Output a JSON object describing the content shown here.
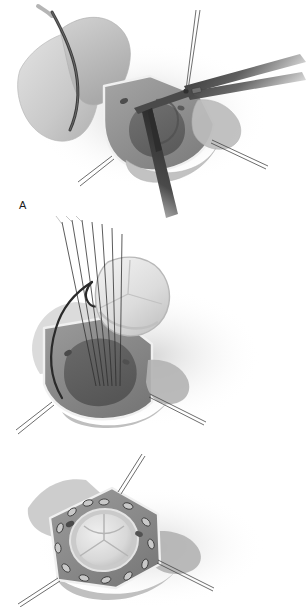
{
  "figure": {
    "background_color": "#ffffff",
    "width": 306,
    "height": 607,
    "style": "grayscale medical line-and-wash illustration",
    "panel_count": 3
  },
  "labels": {
    "panel_a": "A",
    "panel_b": "B"
  },
  "panels": [
    {
      "id": "panel-a",
      "label": "A",
      "caption_text": "A",
      "description": "Excision of the diseased native aortic valve leaflets through an aortotomy, using scissors and forceps",
      "instruments": [
        "scissors",
        "forceps",
        "stay-suture",
        "retraction-suture"
      ],
      "anatomy": [
        "aortotomy-flap",
        "aortic-root",
        "aortic-wall",
        "coronary-ostium",
        "native-valve-leaflet"
      ]
    },
    {
      "id": "panel-b",
      "label": "B",
      "caption_text": "B",
      "description": "Prosthetic valve lowered into the aortic annulus along previously placed parallel annular sutures",
      "instruments": [
        "parallel-annular-sutures",
        "stay-suture",
        "retraction-suture"
      ],
      "anatomy": [
        "aortic-root",
        "aortic-annulus",
        "coronary-ostium",
        "prosthetic-valve"
      ]
    },
    {
      "id": "panel-c",
      "label": "",
      "caption_text": "",
      "description": "Prosthetic valve seated in the annulus with a circumferential ring of pledgeted mattress sutures tied down",
      "instruments": [
        "pledgeted-sutures",
        "stay-suture"
      ],
      "anatomy": [
        "aortic-root",
        "aortic-annulus",
        "coronary-ostium",
        "prosthetic-valve",
        "valve-leaflets"
      ]
    }
  ],
  "colors": {
    "background": "#ffffff",
    "tissue_light": "#d9d9d9",
    "tissue_mid": "#b6b6b6",
    "tissue_dark": "#8e8e8e",
    "lumen_dark": "#6f6f6f",
    "lumen_darkest": "#5a5a5a",
    "highlight_edge": "#f2f2f2",
    "instrument_dark": "#3a3a3a",
    "instrument_mid": "#6a6a6a",
    "suture_line": "#2b2b2b",
    "prosthesis_light": "#e6e6e6",
    "prosthesis_shadow": "#c4c4c4",
    "label_text": "#1c1c1c"
  },
  "panel_c_detail": {
    "pledget_count": 13,
    "pledget_fill": "#c9c9c9",
    "pledget_stroke": "#3c3c3c",
    "valve_leaflet_count": 3
  }
}
